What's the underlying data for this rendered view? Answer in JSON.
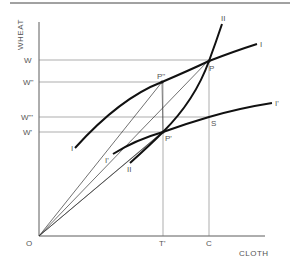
{
  "axes": {
    "x_label": "CLOTH",
    "y_label": "WHEAT",
    "origin_label": "O"
  },
  "y_ticks": [
    {
      "label": "W",
      "y": 60
    },
    {
      "label": "W''",
      "y": 82
    },
    {
      "label": "W'''",
      "y": 117
    },
    {
      "label": "W'",
      "y": 132
    }
  ],
  "x_ticks": [
    {
      "label": "T'",
      "x": 163
    },
    {
      "label": "C",
      "x": 209
    }
  ],
  "points": {
    "P": "P",
    "P_double": "P''",
    "P_prime": "P'",
    "S": "S"
  },
  "curves": {
    "I_left": "I",
    "I_right": "I",
    "I_prime_left": "I'",
    "I_prime_right": "I'",
    "II_top": "II",
    "II_bottom": "II"
  },
  "colors": {
    "line": "#111111",
    "thin": "#333333",
    "guide": "#777777",
    "text": "#555555"
  }
}
